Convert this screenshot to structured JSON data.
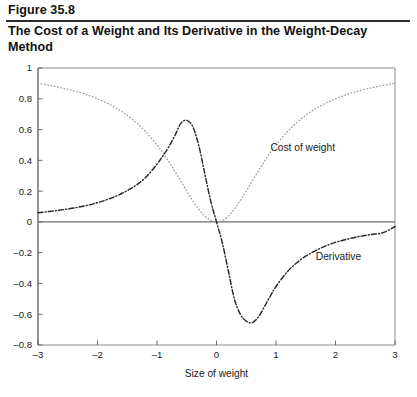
{
  "header": {
    "figure_number": "Figure 35.8",
    "title": "The Cost of a Weight and Its Derivative in the Weight-Decay Method"
  },
  "chart_data": {
    "type": "line",
    "title": "The Cost of a Weight and Its Derivative in the Weight-Decay Method",
    "xlabel": "Size of weight",
    "ylabel": "",
    "xlim": [
      -3,
      3
    ],
    "ylim": [
      -0.8,
      1
    ],
    "grid": false,
    "legend_position": "inline-annotations",
    "xticks": [
      "-3",
      "-2",
      "-1",
      "0",
      "1",
      "2",
      "3"
    ],
    "xtick_values": [
      -3,
      -2,
      -1,
      0,
      1,
      2,
      3
    ],
    "yticks": [
      "1",
      "0.8",
      "0.6",
      "0.4",
      "0.2",
      "0",
      "-0.2",
      "-0.4",
      "-0.6",
      "-0.8"
    ],
    "ytick_values": [
      1,
      0.8,
      0.6,
      0.4,
      0.2,
      0,
      -0.2,
      -0.4,
      -0.6,
      -0.8
    ],
    "annotations": [
      {
        "text": "Cost of weight",
        "x": 1.45,
        "y": 0.46
      },
      {
        "text": "Derivative",
        "x": 2.05,
        "y": -0.245
      }
    ],
    "series": [
      {
        "name": "Cost of weight",
        "style": "dotted",
        "color": "#9a9a9a",
        "x": [
          -3.0,
          -2.8,
          -2.6,
          -2.4,
          -2.2,
          -2.0,
          -1.8,
          -1.6,
          -1.4,
          -1.2,
          -1.0,
          -0.9,
          -0.8,
          -0.7,
          -0.6,
          -0.5,
          -0.4,
          -0.3,
          -0.2,
          -0.1,
          0.0,
          0.1,
          0.2,
          0.3,
          0.4,
          0.5,
          0.6,
          0.7,
          0.8,
          0.9,
          1.0,
          1.2,
          1.4,
          1.6,
          1.8,
          2.0,
          2.2,
          2.4,
          2.6,
          2.8,
          3.0
        ],
        "y": [
          0.9,
          0.887,
          0.871,
          0.852,
          0.829,
          0.8,
          0.764,
          0.719,
          0.662,
          0.59,
          0.5,
          0.448,
          0.39,
          0.329,
          0.265,
          0.2,
          0.138,
          0.083,
          0.038,
          0.01,
          0.0,
          0.01,
          0.038,
          0.083,
          0.138,
          0.2,
          0.265,
          0.329,
          0.39,
          0.448,
          0.5,
          0.59,
          0.662,
          0.719,
          0.764,
          0.8,
          0.829,
          0.852,
          0.871,
          0.887,
          0.9
        ]
      },
      {
        "name": "Derivative",
        "style": "dash-dot",
        "color": "#262626",
        "x": [
          -3.0,
          -2.8,
          -2.6,
          -2.4,
          -2.2,
          -2.0,
          -1.8,
          -1.6,
          -1.4,
          -1.2,
          -1.0,
          -0.9,
          -0.8,
          -0.7,
          -0.6,
          -0.5,
          -0.4,
          -0.3,
          -0.2,
          -0.1,
          0.0,
          0.1,
          0.2,
          0.3,
          0.4,
          0.5,
          0.6,
          0.7,
          0.8,
          0.9,
          1.0,
          1.2,
          1.4,
          1.6,
          1.8,
          2.0,
          2.2,
          2.4,
          2.6,
          2.8,
          3.0
        ],
        "y": [
          0.06,
          0.068,
          0.078,
          0.09,
          0.105,
          0.125,
          0.15,
          0.183,
          0.226,
          0.285,
          0.375,
          0.43,
          0.49,
          0.56,
          0.64,
          0.66,
          0.62,
          0.5,
          0.32,
          0.14,
          0.0,
          -0.14,
          -0.32,
          -0.5,
          -0.6,
          -0.645,
          -0.655,
          -0.62,
          -0.555,
          -0.485,
          -0.42,
          -0.32,
          -0.25,
          -0.2,
          -0.162,
          -0.133,
          -0.112,
          -0.095,
          -0.082,
          -0.07,
          -0.03
        ]
      }
    ]
  }
}
